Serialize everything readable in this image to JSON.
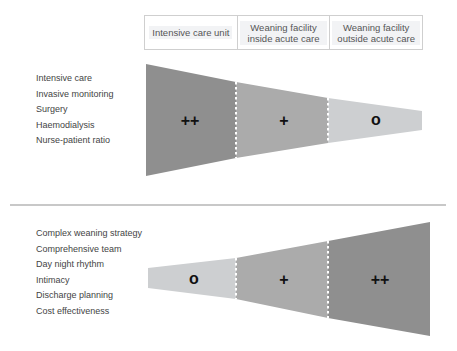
{
  "header": {
    "columns": [
      "Intensive care unit",
      "Weaning facility inside acute care",
      "Weaning facility outside acute care"
    ]
  },
  "top_panel": {
    "criteria": [
      "Intensive care",
      "Invasive monitoring",
      "Surgery",
      "Haemodialysis",
      "Nurse-patient ratio"
    ],
    "ratings": [
      "++",
      "+",
      "o"
    ],
    "segment_colors": [
      "#8f8f8f",
      "#ababab",
      "#cdcfd1"
    ]
  },
  "bottom_panel": {
    "criteria": [
      "Complex weaning strategy",
      "Comprehensive team",
      "Day night rhythm",
      "Intimacy",
      "Discharge planning",
      "Cost effectiveness"
    ],
    "ratings": [
      "o",
      "+",
      "++"
    ],
    "segment_colors": [
      "#cdcfd1",
      "#ababab",
      "#8f8f8f"
    ]
  }
}
